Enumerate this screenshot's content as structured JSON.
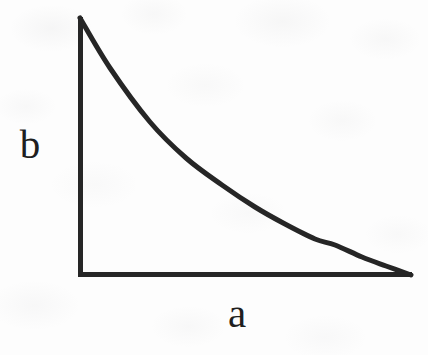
{
  "figure": {
    "kind": "line-plot-sketch",
    "background_color": "#fdfdfd",
    "ink_color": "#262626",
    "label_color": "#1f1f1f",
    "axes": {
      "x_axis_label": "a",
      "y_axis_label": "b",
      "x_axis_tick_labels": [],
      "y_axis_tick_labels": [],
      "grid": false,
      "legend": null,
      "title": null
    }
  },
  "chart_data": {
    "type": "line",
    "title": "",
    "subtitle": "",
    "xlabel": "a",
    "ylabel": "b",
    "grid": false,
    "legend": null,
    "axis_tick_labels": {
      "x": [],
      "y": []
    },
    "xlim": [
      0,
      1
    ],
    "ylim": [
      0,
      1
    ],
    "series": [
      {
        "name": "decay-curve",
        "x": [
          0.0,
          0.09,
          0.21,
          0.32,
          0.43,
          0.53,
          0.62,
          0.71,
          0.77,
          0.85,
          0.92,
          1.0
        ],
        "y": [
          1.0,
          0.81,
          0.61,
          0.47,
          0.37,
          0.29,
          0.23,
          0.17,
          0.14,
          0.1,
          0.06,
          0.01
        ]
      }
    ],
    "pixel_geometry": {
      "origin": [
        78,
        277
      ],
      "y_axis_top": [
        78,
        17
      ],
      "x_axis_right": [
        412,
        277
      ],
      "line_width_px": 5,
      "curve_points_px": [
        [
          80,
          18
        ],
        [
          110,
          68
        ],
        [
          150,
          122
        ],
        [
          186,
          158
        ],
        [
          222,
          185
        ],
        [
          255,
          207
        ],
        [
          285,
          224
        ],
        [
          315,
          239
        ],
        [
          335,
          245
        ],
        [
          362,
          257
        ],
        [
          386,
          266
        ],
        [
          411,
          275
        ]
      ]
    }
  }
}
